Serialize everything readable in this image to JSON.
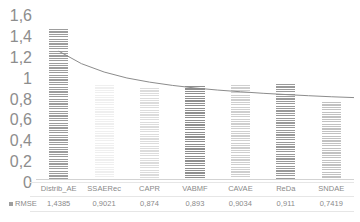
{
  "chart_data": {
    "type": "bar",
    "title": "",
    "xlabel": "",
    "ylabel": "",
    "categories": [
      "Distrib_AE",
      "SSAERec",
      "CAPR",
      "VABMF",
      "CAVAE",
      "ReDa",
      "SNDAE"
    ],
    "values": [
      1.4385,
      0.9021,
      0.874,
      0.893,
      0.9034,
      0.911,
      0.7419
    ],
    "value_labels": [
      "1,4385",
      "0,9021",
      "0,874",
      "0,893",
      "0,9034",
      "0,911",
      "0,7419"
    ],
    "series": [
      {
        "name": "RMSE",
        "values": [
          1.4385,
          0.9021,
          0.874,
          0.893,
          0.9034,
          0.911,
          0.7419
        ]
      }
    ],
    "ylim": [
      0,
      1.6
    ],
    "ytick_values": [
      0,
      0.2,
      0.4,
      0.6,
      0.8,
      1.0,
      1.2,
      1.4,
      1.6
    ],
    "ytick_labels": [
      "0",
      "0,2",
      "0,4",
      "0,6",
      "0,8",
      "1",
      "1,2",
      "1,4",
      "1,6"
    ],
    "grid": false,
    "legend_position": "bottom-left",
    "legend_entries": [
      "RMSE"
    ],
    "decimal_separator": ",",
    "bar_colors": [
      "#9d9d9d",
      "#efefef",
      "#dcdcdc",
      "#8f8f8f",
      "#cfcfcf",
      "#9a9a9a",
      "#c2c2c2"
    ],
    "bar_pattern": "horizontal-lines",
    "trendline": {
      "type": "power-decay",
      "color": "#8c8c8c",
      "points": [
        {
          "x": 0.0,
          "y": 1.225
        },
        {
          "x": 0.5,
          "y": 1.105
        },
        {
          "x": 1.0,
          "y": 1.025
        },
        {
          "x": 1.5,
          "y": 0.968
        },
        {
          "x": 2.0,
          "y": 0.928
        },
        {
          "x": 2.5,
          "y": 0.897
        },
        {
          "x": 3.0,
          "y": 0.872
        },
        {
          "x": 3.5,
          "y": 0.852
        },
        {
          "x": 4.0,
          "y": 0.836
        },
        {
          "x": 4.5,
          "y": 0.821
        },
        {
          "x": 5.0,
          "y": 0.809
        },
        {
          "x": 5.5,
          "y": 0.798
        },
        {
          "x": 6.0,
          "y": 0.788
        },
        {
          "x": 6.5,
          "y": 0.78
        }
      ]
    }
  },
  "legend": {
    "marker_label": "RMSE"
  }
}
